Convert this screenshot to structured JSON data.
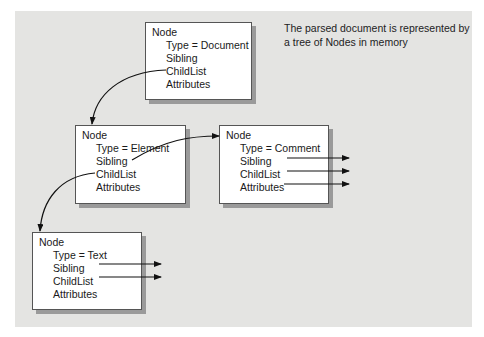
{
  "caption_fragment": "g  pyping",
  "note": {
    "line1": "The parsed document is represented by",
    "line2": "a tree of Nodes in memory"
  },
  "nodes": {
    "document": {
      "title": "Node",
      "type": "Type = Document",
      "sibling": "Sibling",
      "childlist": "ChildList",
      "attributes": "Attributes"
    },
    "element": {
      "title": "Node",
      "type": "Type = Element",
      "sibling": "Sibling",
      "childlist": "ChildList",
      "attributes": "Attributes"
    },
    "comment": {
      "title": "Node",
      "type": "Type = Comment",
      "sibling": "Sibling",
      "childlist": "ChildList",
      "attributes": "Attributes"
    },
    "text": {
      "title": "Node",
      "type": "Type = Text",
      "sibling": "Sibling",
      "childlist": "ChildList",
      "attributes": "Attributes"
    }
  },
  "edges": [
    {
      "from": "document.ChildList",
      "to": "element"
    },
    {
      "from": "element.Sibling",
      "to": "comment"
    },
    {
      "from": "element.ChildList",
      "to": "text"
    },
    {
      "from": "comment.Sibling",
      "to": "external"
    },
    {
      "from": "comment.ChildList",
      "to": "external"
    },
    {
      "from": "comment.Attributes",
      "to": "external"
    },
    {
      "from": "text.Sibling",
      "to": "external"
    },
    {
      "from": "text.ChildList",
      "to": "external"
    }
  ],
  "colors": {
    "panel": "#e4e4e2",
    "box": "#ffffff",
    "shadow": "#9a9a9a",
    "line": "#111111"
  }
}
